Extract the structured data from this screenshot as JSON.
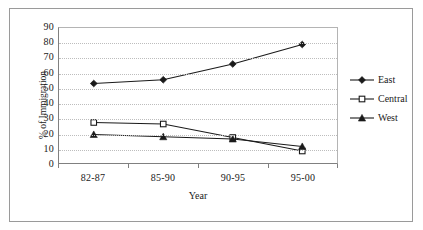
{
  "chart_data": {
    "type": "line",
    "title": "",
    "xlabel": "Year",
    "ylabel": "% of Immigration",
    "categories": [
      "82-87",
      "85-90",
      "90-95",
      "95-00"
    ],
    "ylim": [
      0,
      90
    ],
    "ytick_step": 10,
    "yticks": [
      "90",
      "80",
      "70",
      "60",
      "50",
      "40",
      "30",
      "20",
      "10",
      "0"
    ],
    "grid": "horizontal-dotted",
    "legend_position": "right",
    "series": [
      {
        "name": "East",
        "marker": "filled-diamond",
        "color": "#1a1a1a",
        "values": [
          53,
          55.5,
          66,
          79
        ]
      },
      {
        "name": "Central",
        "marker": "open-square",
        "color": "#1a1a1a",
        "values": [
          27,
          26,
          17,
          8
        ]
      },
      {
        "name": "West",
        "marker": "filled-triangle",
        "color": "#1a1a1a",
        "values": [
          19,
          17.5,
          16,
          11
        ]
      }
    ]
  },
  "axis": {
    "y_title": "% of Immigration",
    "x_title": "Year"
  },
  "legend": {
    "items": [
      {
        "label": "East"
      },
      {
        "label": "Central"
      },
      {
        "label": "West"
      }
    ]
  }
}
